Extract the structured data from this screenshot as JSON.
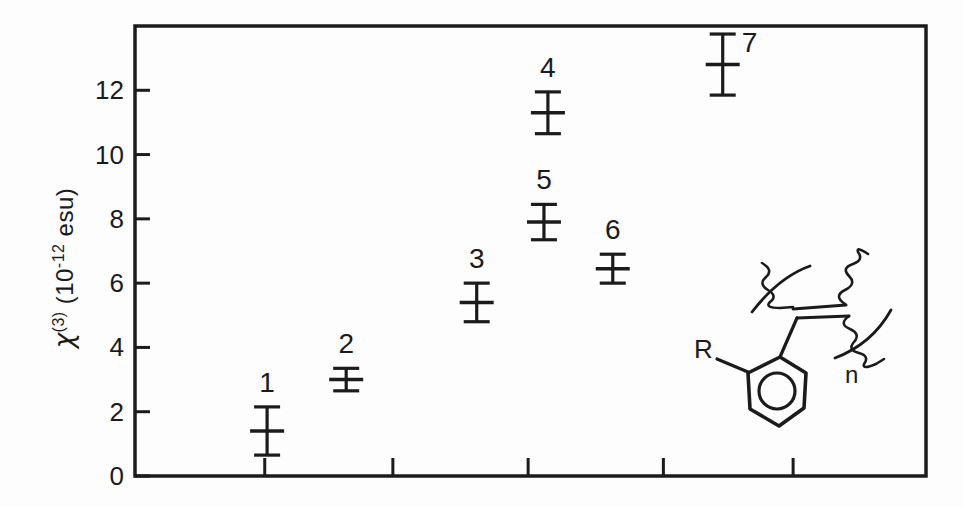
{
  "colors": {
    "ink": "#1b1b1b",
    "background": "#fdfdfd"
  },
  "y_axis_label": {
    "chi": "χ",
    "sup_order": "(3)",
    "paren_open": "(10",
    "sup_exp": "-12",
    "unit": " esu)"
  },
  "structure_inset": {
    "r_label": "R",
    "n_label": "n"
  },
  "chart_data": {
    "type": "scatter",
    "title": "",
    "xlabel": "",
    "ylabel": "chi^(3) (10^-12 esu)",
    "ylim": [
      0,
      14
    ],
    "grid": false,
    "legend": "none",
    "x_axis_labels": "none",
    "y_ticks": [
      0,
      2,
      4,
      6,
      8,
      10,
      12
    ],
    "x_tick_fracs": [
      0.164,
      0.326,
      0.497,
      0.668,
      0.832
    ],
    "points": [
      {
        "label": "1",
        "x_frac": 0.167,
        "value": 1.4,
        "error": 0.75,
        "label_pos": "above"
      },
      {
        "label": "2",
        "x_frac": 0.267,
        "value": 3.0,
        "error": 0.35,
        "label_pos": "above"
      },
      {
        "label": "3",
        "x_frac": 0.432,
        "value": 5.4,
        "error": 0.6,
        "label_pos": "above"
      },
      {
        "label": "4",
        "x_frac": 0.522,
        "value": 11.3,
        "error": 0.65,
        "label_pos": "above"
      },
      {
        "label": "5",
        "x_frac": 0.517,
        "value": 7.9,
        "error": 0.55,
        "label_pos": "above"
      },
      {
        "label": "6",
        "x_frac": 0.604,
        "value": 6.45,
        "error": 0.45,
        "label_pos": "above"
      },
      {
        "label": "7",
        "x_frac": 0.743,
        "value": 12.8,
        "error": 0.95,
        "label_pos": "right"
      }
    ]
  }
}
